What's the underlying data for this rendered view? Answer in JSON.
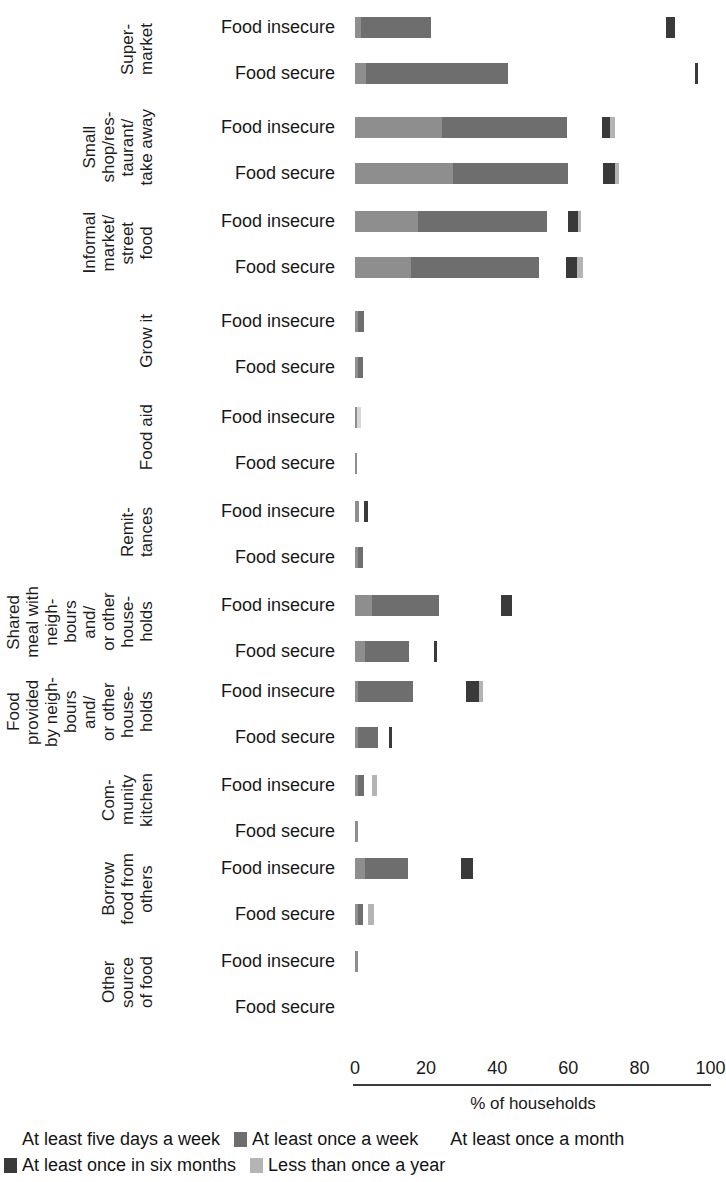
{
  "chart_data": {
    "type": "bar",
    "subtype": "stacked-horizontal",
    "title": "",
    "xlabel": "% of households",
    "ylabel": "",
    "xlim": [
      0,
      100
    ],
    "xticks": [
      0,
      20,
      40,
      60,
      80,
      100
    ],
    "grid": false,
    "legend_position": "bottom",
    "series": [
      {
        "name": "At least five days a week",
        "color": "#8e8e8e"
      },
      {
        "name": "At least once a week",
        "color": "#6e6e6e"
      },
      {
        "name": "At least once a month",
        "color": "#d8d8d8"
      },
      {
        "name": "At least once in six months",
        "color": "#3a3a3a"
      },
      {
        "name": "Less than once a year",
        "color": "#b4b4b4"
      }
    ],
    "groups": [
      {
        "label": "Super-\nmarket",
        "rows": [
          {
            "label": "Food insecure",
            "values": [
              1.7,
              19.7,
              0,
              2.6,
              0
            ],
            "gap_before_last": 66.0
          },
          {
            "label": "Food secure",
            "values": [
              3.1,
              39.9,
              0,
              0.9,
              0
            ],
            "gap_before_last": 52.5
          }
        ]
      },
      {
        "label": "Small\nshop/res-\ntaurant/\ntake away",
        "rows": [
          {
            "label": "Food insecure",
            "values": [
              24.6,
              35.1,
              0,
              2.3,
              1.4
            ],
            "gap_before_last": 9.7
          },
          {
            "label": "Food secure",
            "values": [
              27.7,
              32.3,
              0,
              3.4,
              1.1
            ],
            "gap_before_last": 9.7
          }
        ]
      },
      {
        "label": "Informal\nmarket/\nstreet\nfood",
        "rows": [
          {
            "label": "Food insecure",
            "values": [
              17.7,
              36.3,
              0,
              2.6,
              1.1
            ],
            "gap_before_last": 6.0
          },
          {
            "label": "Food secure",
            "values": [
              15.7,
              36.0,
              0,
              3.1,
              1.7
            ],
            "gap_before_last": 7.7
          }
        ]
      },
      {
        "label": "Grow it",
        "rows": [
          {
            "label": "Food insecure",
            "values": [
              0.9,
              1.7,
              0,
              0,
              0
            ],
            "gap_before_last": 0
          },
          {
            "label": "Food secure",
            "values": [
              0.9,
              1.4,
              0,
              0,
              0
            ],
            "gap_before_last": 0
          }
        ]
      },
      {
        "label": "Food aid",
        "rows": [
          {
            "label": "Food insecure",
            "values": [
              0.6,
              0,
              1.1,
              0,
              0
            ],
            "gap_before_last": 0
          },
          {
            "label": "Food secure",
            "values": [
              0.6,
              0,
              0,
              0,
              0
            ],
            "gap_before_last": 0
          }
        ]
      },
      {
        "label": "Remit-\ntances",
        "rows": [
          {
            "label": "Food insecure",
            "values": [
              1.1,
              0,
              0,
              1.1,
              0
            ],
            "gap_before_last": 1.4
          },
          {
            "label": "Food secure",
            "values": [
              0.9,
              1.4,
              0,
              0,
              0
            ],
            "gap_before_last": 0
          }
        ]
      },
      {
        "label": "Shared\nmeal with\nneigh-\nbours\nand/\nor other\nhouse-\nholds",
        "rows": [
          {
            "label": "Food insecure",
            "values": [
              4.9,
              18.6,
              0,
              3.1,
              0
            ],
            "gap_before_last": 17.7
          },
          {
            "label": "Food secure",
            "values": [
              2.9,
              12.3,
              0,
              0.9,
              0
            ],
            "gap_before_last": 6.9
          }
        ]
      },
      {
        "label": "Food\nprovided\nby neigh-\nbours\nand/\nor other\nhouse-\nholds",
        "rows": [
          {
            "label": "Food insecure",
            "values": [
              0.9,
              15.4,
              0,
              3.7,
              1.1
            ],
            "gap_before_last": 14.9
          },
          {
            "label": "Food secure",
            "values": [
              0.9,
              5.7,
              0,
              0.9,
              0
            ],
            "gap_before_last": 2.9
          }
        ]
      },
      {
        "label": "Com-\nmunity\nkitchen",
        "rows": [
          {
            "label": "Food insecure",
            "values": [
              0.9,
              1.7,
              0,
              0,
              1.4
            ],
            "gap_before_last": 2.3
          },
          {
            "label": "Food secure",
            "values": [
              0.9,
              0,
              0,
              0,
              0
            ],
            "gap_before_last": 0
          }
        ]
      },
      {
        "label": "Borrow\nfood from\nothers",
        "rows": [
          {
            "label": "Food insecure",
            "values": [
              2.9,
              12.0,
              0,
              3.4,
              0
            ],
            "gap_before_last": 14.9
          },
          {
            "label": "Food secure",
            "values": [
              0.9,
              1.4,
              0,
              0,
              1.7
            ],
            "gap_before_last": 1.4
          }
        ]
      },
      {
        "label": "Other\nsource\nof food",
        "rows": [
          {
            "label": "Food insecure",
            "values": [
              0.9,
              0,
              0,
              0,
              0
            ],
            "gap_before_last": 0
          },
          {
            "label": "Food secure",
            "values": [
              0,
              0,
              0,
              0,
              0
            ],
            "gap_before_last": 0
          }
        ]
      }
    ]
  },
  "axis": {
    "title": "% of households",
    "ticks": [
      "0",
      "20",
      "40",
      "60",
      "80",
      "100"
    ]
  },
  "legend": {
    "line1": [
      "At least five days a week",
      "At least once a week",
      "At least once a month"
    ],
    "line2": [
      "At least once in six months",
      "Less than once a year"
    ]
  }
}
